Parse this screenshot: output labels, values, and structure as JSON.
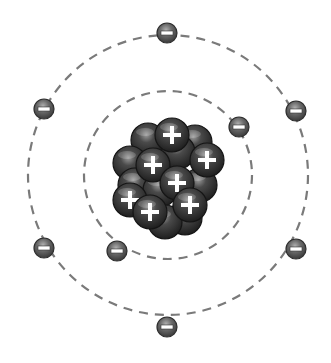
{
  "diagram": {
    "title": "Atom model",
    "nucleus": {
      "center": [
        168,
        175
      ],
      "particle_color": "#3a3a3a",
      "protons": [
        {
          "x": 172,
          "y": 135
        },
        {
          "x": 153,
          "y": 165
        },
        {
          "x": 207,
          "y": 160
        },
        {
          "x": 177,
          "y": 183
        },
        {
          "x": 130,
          "y": 200
        },
        {
          "x": 150,
          "y": 212
        },
        {
          "x": 190,
          "y": 205
        }
      ],
      "neutrons": [
        {
          "x": 148,
          "y": 140
        },
        {
          "x": 195,
          "y": 142
        },
        {
          "x": 130,
          "y": 163
        },
        {
          "x": 178,
          "y": 152
        },
        {
          "x": 200,
          "y": 185
        },
        {
          "x": 135,
          "y": 185
        },
        {
          "x": 160,
          "y": 190
        },
        {
          "x": 185,
          "y": 218
        },
        {
          "x": 165,
          "y": 222
        }
      ]
    },
    "orbits": [
      {
        "name": "inner-shell",
        "radius": 84,
        "color": "#7a7a7a"
      },
      {
        "name": "outer-shell",
        "radius": 140,
        "color": "#7a7a7a"
      }
    ],
    "electrons": [
      {
        "shell": "inner",
        "x": 239,
        "y": 127
      },
      {
        "shell": "inner",
        "x": 117,
        "y": 251
      },
      {
        "shell": "outer",
        "x": 167,
        "y": 33
      },
      {
        "shell": "outer",
        "x": 44,
        "y": 109
      },
      {
        "shell": "outer",
        "x": 296,
        "y": 111
      },
      {
        "shell": "outer",
        "x": 44,
        "y": 248
      },
      {
        "shell": "outer",
        "x": 296,
        "y": 249
      },
      {
        "shell": "outer",
        "x": 167,
        "y": 327
      }
    ],
    "electron_color": "#666666",
    "proton_symbol": "+",
    "electron_symbol": "−"
  }
}
